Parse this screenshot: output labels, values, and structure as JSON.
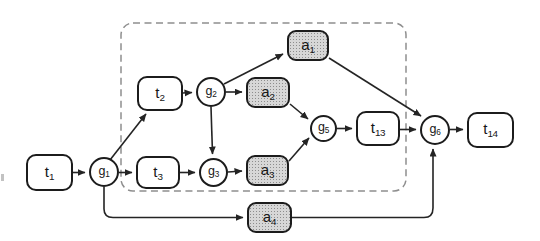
{
  "diagram": {
    "colors": {
      "background": "#ffffff",
      "node_fill": "#ffffff",
      "node_border": "#1c1c1c",
      "action_fill": "#d7d7d7",
      "edge": "#242424",
      "boundary": "#8e8e8e"
    },
    "dashed_boundary": {
      "x": 121,
      "y": 23,
      "w": 285,
      "h": 168,
      "rx": 12,
      "dash": "7 4.5"
    },
    "scan_speck": {
      "x": 1,
      "y": 174,
      "w": 3,
      "h": 7
    },
    "nodes": [
      {
        "id": "t1",
        "label": {
          "base": "t",
          "sub": "1"
        },
        "type": "task",
        "shape": "roundrect",
        "x": 26,
        "y": 154,
        "w": 47,
        "h": 37
      },
      {
        "id": "g1",
        "label": {
          "base": "g",
          "sub": "1"
        },
        "type": "gateway",
        "shape": "circle",
        "x": 89,
        "y": 157,
        "w": 30,
        "h": 30
      },
      {
        "id": "t2",
        "label": {
          "base": "t",
          "sub": "2"
        },
        "type": "task",
        "shape": "roundrect",
        "x": 137,
        "y": 76,
        "w": 46,
        "h": 35
      },
      {
        "id": "g2",
        "label": {
          "base": "g",
          "sub": "2"
        },
        "type": "gateway",
        "shape": "circle",
        "x": 196,
        "y": 77,
        "w": 30,
        "h": 30
      },
      {
        "id": "a2",
        "label": {
          "base": "a",
          "sub": "2"
        },
        "type": "action",
        "shape": "roundrect",
        "x": 246,
        "y": 77,
        "w": 44,
        "h": 31
      },
      {
        "id": "a1",
        "label": {
          "base": "a",
          "sub": "1"
        },
        "type": "action",
        "shape": "roundrect",
        "x": 287,
        "y": 30,
        "w": 42,
        "h": 31
      },
      {
        "id": "t3",
        "label": {
          "base": "t",
          "sub": "3"
        },
        "type": "task",
        "shape": "roundrect",
        "x": 136,
        "y": 156,
        "w": 44,
        "h": 33
      },
      {
        "id": "g3",
        "label": {
          "base": "g",
          "sub": "3"
        },
        "type": "gateway",
        "shape": "circle",
        "x": 199,
        "y": 158,
        "w": 29,
        "h": 29
      },
      {
        "id": "a3",
        "label": {
          "base": "a",
          "sub": "3"
        },
        "type": "action",
        "shape": "roundrect",
        "x": 246,
        "y": 155,
        "w": 43,
        "h": 31
      },
      {
        "id": "g5",
        "label": {
          "base": "g",
          "sub": "5"
        },
        "type": "gateway",
        "shape": "circle",
        "x": 310,
        "y": 115,
        "w": 27,
        "h": 27
      },
      {
        "id": "t13",
        "label": {
          "base": "t",
          "sub": "13"
        },
        "type": "task",
        "shape": "roundrect",
        "x": 356,
        "y": 111,
        "w": 44,
        "h": 35
      },
      {
        "id": "g6",
        "label": {
          "base": "g",
          "sub": "6"
        },
        "type": "gateway",
        "shape": "circle",
        "x": 420,
        "y": 115,
        "w": 30,
        "h": 30
      },
      {
        "id": "t14",
        "label": {
          "base": "t",
          "sub": "14"
        },
        "type": "task",
        "shape": "roundrect",
        "x": 467,
        "y": 112,
        "w": 47,
        "h": 36
      },
      {
        "id": "a4",
        "label": {
          "base": "a",
          "sub": "4"
        },
        "type": "action",
        "shape": "roundrect",
        "x": 247,
        "y": 202,
        "w": 45,
        "h": 31
      }
    ],
    "edges": [
      {
        "id": "t1-g1",
        "from": "t1",
        "to": "g1",
        "d": "M73,172.5 L85,172.5"
      },
      {
        "id": "g1-t2",
        "from": "g1",
        "to": "t2",
        "d": "M110,160 L146,114"
      },
      {
        "id": "g1-t3",
        "from": "g1",
        "to": "t3",
        "d": "M119,172.5 L132,172.5"
      },
      {
        "id": "g1-a4",
        "from": "g1",
        "to": "a4",
        "d": "M104,187 L104,209 Q104,217.5 113,217.5 L243,217.5"
      },
      {
        "id": "t2-g2",
        "from": "t2",
        "to": "g2",
        "d": "M183,93 L192,92.5"
      },
      {
        "id": "g2-a1",
        "from": "g2",
        "to": "a1",
        "d": "M224,84 L283,54"
      },
      {
        "id": "g2-a2",
        "from": "g2",
        "to": "a2",
        "d": "M226,92 L242,92"
      },
      {
        "id": "g2-g3",
        "from": "g2",
        "to": "g3",
        "d": "M211,107 L212.5,154"
      },
      {
        "id": "t3-g3",
        "from": "t3",
        "to": "g3",
        "d": "M180,172.5 L195,172.5"
      },
      {
        "id": "g3-a3",
        "from": "g3",
        "to": "a3",
        "d": "M228,172 L242,171"
      },
      {
        "id": "a2-g5",
        "from": "a2",
        "to": "g5",
        "d": "M290,104 L308,119"
      },
      {
        "id": "a3-g5",
        "from": "a3",
        "to": "g5",
        "d": "M289,161 L309,138"
      },
      {
        "id": "a1-g6",
        "from": "a1",
        "to": "g6",
        "d": "M329,58 L421,116"
      },
      {
        "id": "g5-t13",
        "from": "g5",
        "to": "t13",
        "d": "M337,128.5 L352,128.5"
      },
      {
        "id": "t13-g6",
        "from": "t13",
        "to": "g6",
        "d": "M400,129.5 L416,129.5"
      },
      {
        "id": "g6-t14",
        "from": "g6",
        "to": "t14",
        "d": "M450,129.5 L463,129.5"
      },
      {
        "id": "a4-g6",
        "from": "a4",
        "to": "g6",
        "d": "M292,217.5 L424,217.5 Q433,217.5 433,208 L433,149"
      }
    ]
  }
}
